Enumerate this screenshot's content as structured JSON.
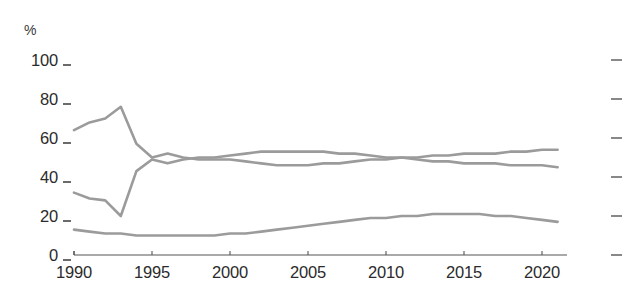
{
  "chart_data": {
    "type": "line",
    "title": "",
    "subtitle": "",
    "xlabel": "",
    "ylabel": "%",
    "unit_label": "%",
    "xlim": [
      1990,
      2021
    ],
    "ylim": [
      0,
      100
    ],
    "grid": false,
    "legend": "none",
    "line_color": "#9b9b9b",
    "axis_color": "#555555",
    "text_color": "#2b2b2b",
    "yticks": [
      0,
      20,
      40,
      60,
      80,
      100
    ],
    "ytick_labels": [
      "0",
      "20",
      "40",
      "60",
      "80",
      "100"
    ],
    "xticks": [
      1990,
      1995,
      2000,
      2005,
      2010,
      2015,
      2020
    ],
    "xtick_labels": [
      "1990",
      "1995",
      "2000",
      "2005",
      "2010",
      "2015",
      "2020"
    ],
    "right_axis_ticks": [
      0,
      20,
      40,
      60,
      80,
      100
    ],
    "x": [
      1990,
      1991,
      1992,
      1993,
      1994,
      1995,
      1996,
      1997,
      1998,
      1999,
      2000,
      2001,
      2002,
      2003,
      2004,
      2005,
      2006,
      2007,
      2008,
      2009,
      2010,
      2011,
      2012,
      2013,
      2014,
      2015,
      2016,
      2017,
      2018,
      2019,
      2020,
      2021
    ],
    "series": [
      {
        "name": "series-a",
        "values": [
          64,
          68,
          70,
          76,
          57,
          50,
          52,
          50,
          49,
          49,
          49,
          48,
          47,
          46,
          46,
          46,
          47,
          47,
          48,
          49,
          49,
          50,
          50,
          51,
          51,
          52,
          52,
          52,
          53,
          53,
          54,
          54
        ]
      },
      {
        "name": "series-b",
        "values": [
          32,
          29,
          28,
          20,
          43,
          49,
          47,
          49,
          50,
          50,
          51,
          52,
          53,
          53,
          53,
          53,
          53,
          52,
          52,
          51,
          50,
          50,
          49,
          48,
          48,
          47,
          47,
          47,
          46,
          46,
          46,
          45
        ]
      },
      {
        "name": "series-c",
        "values": [
          13,
          12,
          11,
          11,
          10,
          10,
          10,
          10,
          10,
          10,
          11,
          11,
          12,
          13,
          14,
          15,
          16,
          17,
          18,
          19,
          19,
          20,
          20,
          21,
          21,
          21,
          21,
          20,
          20,
          19,
          18,
          17
        ]
      }
    ]
  }
}
